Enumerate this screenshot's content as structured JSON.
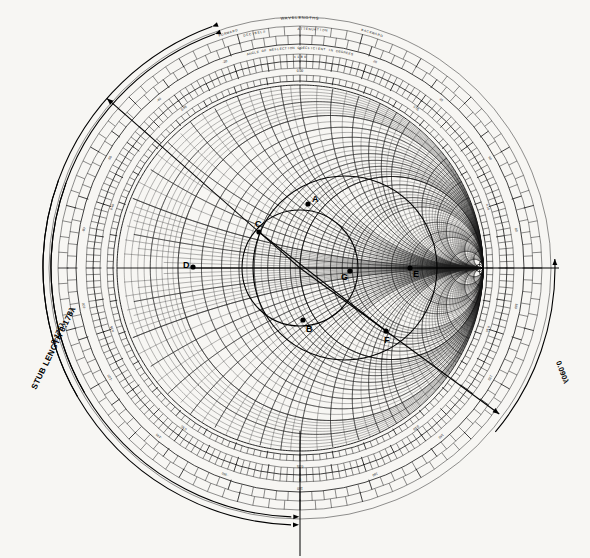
{
  "document": {
    "title": "Smith Chart with single-stub matching construction",
    "background_color": "#f7f6f3",
    "ink_color": "#111111"
  },
  "chart_data": {
    "type": "scatter",
    "xlabel": "",
    "ylabel": "",
    "coordinate_system": "normalized reflection coefficient unit circle",
    "center": {
      "x": 300,
      "y": 268
    },
    "radius": 183,
    "grid": {
      "resistance_circles": [
        0.1,
        0.2,
        0.3,
        0.4,
        0.5,
        0.6,
        0.7,
        0.8,
        0.9,
        1.0,
        1.2,
        1.4,
        1.6,
        1.8,
        2.0,
        3.0,
        4.0,
        5.0,
        10.0,
        20.0,
        50.0
      ],
      "reactance_arcs": [
        0.1,
        0.2,
        0.3,
        0.4,
        0.5,
        0.6,
        0.7,
        0.8,
        0.9,
        1.0,
        1.2,
        1.4,
        1.6,
        1.8,
        2.0,
        3.0,
        4.0,
        5.0,
        10.0,
        20.0,
        50.0
      ],
      "grid_on": true
    },
    "annotated_points": [
      {
        "label": "A",
        "x": 308,
        "y": 204,
        "note": "top of constant-VSWR circle"
      },
      {
        "label": "B",
        "x": 303,
        "y": 320,
        "note": "bottom of constant-VSWR circle"
      },
      {
        "label": "C",
        "x": 259,
        "y": 232,
        "note": "intersection with unity-conductance circle, upper"
      },
      {
        "label": "D",
        "x": 193,
        "y": 267,
        "note": "left real-axis intercept"
      },
      {
        "label": "E",
        "x": 410,
        "y": 268,
        "note": "right real-axis intercept"
      },
      {
        "label": "F",
        "x": 386,
        "y": 331,
        "note": "intersection on lower right"
      },
      {
        "label": "G",
        "x": 350,
        "y": 271,
        "note": "load admittance point"
      }
    ],
    "annotations": [
      {
        "text": "STUB LENGTH 0.178λ",
        "x": 36,
        "y": 390,
        "rotation": -64
      },
      {
        "text": "0.175λ",
        "x": 55,
        "y": 345,
        "rotation": -64
      },
      {
        "text": "0.090λ",
        "x": 556,
        "y": 362,
        "rotation": 70
      }
    ],
    "vswr_circle": {
      "center": {
        "x": 300,
        "y": 268
      },
      "radius": 58
    },
    "unity_conductance_circle": {
      "center": {
        "x": 345,
        "y": 268
      },
      "radius": 92
    },
    "chord": {
      "from": {
        "x": 259,
        "y": 232
      },
      "to": {
        "x": 386,
        "y": 331
      }
    },
    "radial_arrows": [
      {
        "name": "stub-length-outer-arrow",
        "direction": "up-left"
      },
      {
        "name": "stub-length-inner-arrow",
        "direction": "up-left"
      },
      {
        "name": "load-right-arrow",
        "direction": "up"
      },
      {
        "name": "lower-right-arrow",
        "direction": "down-left"
      },
      {
        "name": "bottom-arrow-outer",
        "direction": "right"
      },
      {
        "name": "bottom-arrow-inner",
        "direction": "right"
      }
    ]
  },
  "scales": {
    "header_rows": [
      {
        "id": "wavelengths",
        "left": "FORWARD",
        "center": "WAVELENGTHS",
        "right": "BACKWARD"
      },
      {
        "id": "attenuation",
        "left": "DECIBELS",
        "center": "ATTENUATION",
        "right": ""
      },
      {
        "id": "angle",
        "center": "ANGLE OF REFLECTION COEFFICIENT IN DEGREES"
      }
    ],
    "rings": [
      {
        "name": "wavelengths-toward-generator",
        "label": "WAVELENGTHS TOWARD GENERATOR"
      },
      {
        "name": "wavelengths-toward-load",
        "label": "WAVELENGTHS TOWARD LOAD"
      },
      {
        "name": "angle-of-reflection-coefficient",
        "label": "ANGLE OF REFLECTION COEFFICIENT IN DEGREES"
      },
      {
        "name": "decibels-attenuation",
        "label": "DECIBELS ATTENUATION"
      }
    ],
    "angle_ticks": [
      "0",
      "20",
      "40",
      "60",
      "80",
      "100",
      "120",
      "140",
      "160",
      "180",
      "-160",
      "-140",
      "-120",
      "-100",
      "-80",
      "-60",
      "-40",
      "-20"
    ],
    "wavelength_ticks": [
      "0.00",
      "0.05",
      "0.10",
      "0.15",
      "0.20",
      "0.25",
      "0.30",
      "0.35",
      "0.40",
      "0.45"
    ],
    "top_center_marker": "±180",
    "bottom_center_marker": "0"
  }
}
